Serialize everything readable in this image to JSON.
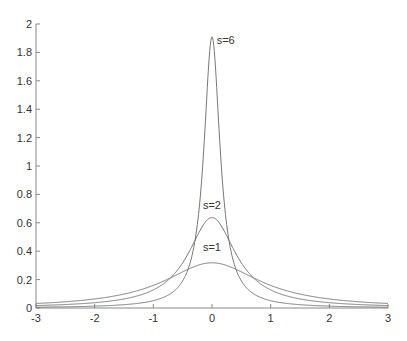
{
  "chart_data": {
    "type": "line",
    "title": "",
    "xlabel": "",
    "ylabel": "",
    "xlim": [
      -3,
      3
    ],
    "ylim": [
      0,
      2
    ],
    "grid": false,
    "legend": "none (inline curve labels)",
    "x_ticks": [
      -3,
      -2,
      -1,
      0,
      1,
      2,
      3
    ],
    "x_tick_labels": [
      "-3",
      "-2",
      "-1",
      "0",
      "1",
      "2",
      "3"
    ],
    "y_ticks": [
      0,
      0.2,
      0.4,
      0.6,
      0.8,
      1,
      1.2,
      1.4,
      1.6,
      1.8,
      2
    ],
    "y_tick_labels": [
      "0",
      "0.2",
      "0.4",
      "0.6",
      "0.8",
      "1",
      "1.2",
      "1.4",
      "1.6",
      "1.8",
      "2"
    ],
    "x": [
      -3,
      -2.5,
      -2,
      -1.5,
      -1,
      -0.75,
      -0.5,
      -0.4,
      -0.3,
      -0.25,
      -0.2,
      -0.15,
      -0.1,
      -0.05,
      0,
      0.05,
      0.1,
      0.15,
      0.2,
      0.25,
      0.3,
      0.4,
      0.5,
      0.75,
      1,
      1.5,
      2,
      2.5,
      3
    ],
    "series": [
      {
        "name": "s=1",
        "label": "s=1",
        "label_pos": [
          0.05,
          0.4
        ],
        "values": [
          0.032,
          0.044,
          0.064,
          0.098,
          0.159,
          0.204,
          0.255,
          0.274,
          0.292,
          0.3,
          0.306,
          0.311,
          0.315,
          0.318,
          0.318,
          0.318,
          0.315,
          0.311,
          0.306,
          0.3,
          0.292,
          0.274,
          0.255,
          0.204,
          0.159,
          0.098,
          0.064,
          0.044,
          0.032
        ]
      },
      {
        "name": "s=2",
        "label": "s=2",
        "label_pos": [
          0.05,
          0.7
        ],
        "values": [
          0.017,
          0.025,
          0.037,
          0.064,
          0.127,
          0.204,
          0.318,
          0.388,
          0.468,
          0.509,
          0.549,
          0.585,
          0.612,
          0.63,
          0.637,
          0.63,
          0.612,
          0.585,
          0.549,
          0.509,
          0.468,
          0.388,
          0.318,
          0.204,
          0.127,
          0.064,
          0.037,
          0.025,
          0.017
        ]
      },
      {
        "name": "s=6",
        "label": "s=6",
        "label_pos": [
          0.08,
          1.86
        ],
        "values": [
          0.006,
          0.008,
          0.013,
          0.023,
          0.052,
          0.091,
          0.191,
          0.28,
          0.432,
          0.555,
          0.783,
          1.066,
          1.404,
          1.762,
          1.91,
          1.762,
          1.404,
          1.066,
          0.783,
          0.555,
          0.432,
          0.28,
          0.191,
          0.091,
          0.052,
          0.023,
          0.013,
          0.008,
          0.006
        ]
      }
    ]
  }
}
